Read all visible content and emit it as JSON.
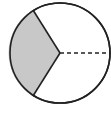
{
  "diagram": {
    "type": "circle-sector",
    "circle": {
      "cx": 60,
      "cy": 53,
      "r": 50,
      "stroke": "#222222",
      "fill": "#ffffff"
    },
    "shaded_sector": {
      "start_point": [
        33,
        10
      ],
      "end_point": [
        33,
        96
      ],
      "fill": "#c8c8c8",
      "fraction": "1/3"
    },
    "solid_radii": [
      {
        "to": [
          33,
          10
        ]
      },
      {
        "to": [
          33,
          96
        ]
      }
    ],
    "dashed_radius": {
      "to": [
        110,
        53
      ],
      "stroke": "#222222"
    },
    "colors": {
      "stroke": "#222222",
      "shade": "#c8c8c8",
      "background": "#ffffff"
    }
  }
}
